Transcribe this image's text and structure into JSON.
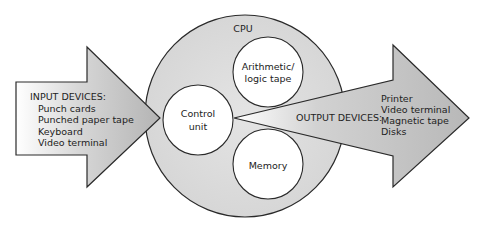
{
  "diagram": {
    "colors": {
      "background": "#ffffff",
      "cpu_fill": "#dadada",
      "arrow_fill": "#bdbdbd",
      "inner_circle_fill": "#ffffff",
      "stroke": "#2a2a2a",
      "text": "#222222"
    },
    "cpu": {
      "label": "CPU"
    },
    "components": {
      "control_unit": {
        "line1": "Control",
        "line2": "unit"
      },
      "alu": {
        "line1": "Arithmetic/",
        "line2": "logic tape"
      },
      "memory": {
        "label": "Memory"
      }
    },
    "input": {
      "heading": "INPUT DEVICES:",
      "items": [
        "Punch cards",
        "Punched paper tape",
        "Keyboard",
        "Video terminal"
      ]
    },
    "output": {
      "heading": "OUTPUT DEVICES:",
      "items": [
        "Printer",
        "Video terminal",
        "Magnetic tape",
        "Disks"
      ]
    }
  }
}
